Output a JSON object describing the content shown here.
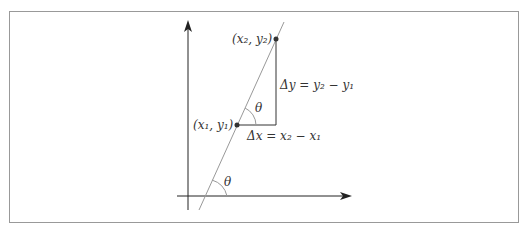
{
  "diagram": {
    "labels": {
      "p2": "(x₂, y₂)",
      "p1": "(x₁, y₁)",
      "dy": "Δy = y₂ − y₁",
      "dx": "Δx = x₂ − x₁",
      "theta_upper": "θ",
      "theta_lower": "θ"
    },
    "colors": {
      "frame": "#888888",
      "axis": "#222222",
      "line": "#999999",
      "triangle": "#333333",
      "point": "#333333"
    }
  }
}
